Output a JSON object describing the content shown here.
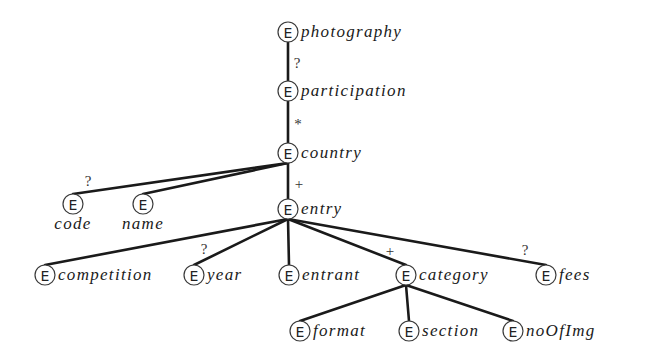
{
  "diagram": {
    "title": "",
    "element_marker": "E",
    "nodes": [
      {
        "id": "photography",
        "label": "photography",
        "x": 288,
        "y": 32,
        "label_pos": "right"
      },
      {
        "id": "participation",
        "label": "participation",
        "x": 288,
        "y": 91,
        "label_pos": "right"
      },
      {
        "id": "country",
        "label": "country",
        "x": 288,
        "y": 153,
        "label_pos": "right"
      },
      {
        "id": "code",
        "label": "code",
        "x": 73,
        "y": 204,
        "label_pos": "below"
      },
      {
        "id": "name",
        "label": "name",
        "x": 143,
        "y": 204,
        "label_pos": "below"
      },
      {
        "id": "entry",
        "label": "entry",
        "x": 288,
        "y": 209,
        "label_pos": "right"
      },
      {
        "id": "competition",
        "label": "competition",
        "x": 45,
        "y": 275,
        "label_pos": "right"
      },
      {
        "id": "year",
        "label": "year",
        "x": 194,
        "y": 275,
        "label_pos": "right"
      },
      {
        "id": "entrant",
        "label": "entrant",
        "x": 289,
        "y": 275,
        "label_pos": "right"
      },
      {
        "id": "category",
        "label": "category",
        "x": 406,
        "y": 275,
        "label_pos": "right"
      },
      {
        "id": "fees",
        "label": "fees",
        "x": 546,
        "y": 275,
        "label_pos": "right"
      },
      {
        "id": "format",
        "label": "format",
        "x": 300,
        "y": 331,
        "label_pos": "right"
      },
      {
        "id": "section",
        "label": "section",
        "x": 409,
        "y": 331,
        "label_pos": "right"
      },
      {
        "id": "noOfImg",
        "label": "noOfImg",
        "x": 513,
        "y": 331,
        "label_pos": "right"
      }
    ],
    "edges": [
      {
        "from": "photography",
        "to": "participation",
        "cardinality": "?",
        "card_x": 297,
        "card_y": 68
      },
      {
        "from": "participation",
        "to": "country",
        "cardinality": "*",
        "card_x": 298,
        "card_y": 129
      },
      {
        "from": "country",
        "to": "code",
        "cardinality": "?",
        "card_x": 88,
        "card_y": 186
      },
      {
        "from": "country",
        "to": "name",
        "cardinality": "",
        "card_x": 0,
        "card_y": 0
      },
      {
        "from": "country",
        "to": "entry",
        "cardinality": "+",
        "card_x": 299,
        "card_y": 189
      },
      {
        "from": "entry",
        "to": "competition",
        "cardinality": "",
        "card_x": 0,
        "card_y": 0
      },
      {
        "from": "entry",
        "to": "year",
        "cardinality": "?",
        "card_x": 204,
        "card_y": 254
      },
      {
        "from": "entry",
        "to": "entrant",
        "cardinality": "",
        "card_x": 0,
        "card_y": 0
      },
      {
        "from": "entry",
        "to": "category",
        "cardinality": "+",
        "card_x": 390,
        "card_y": 256
      },
      {
        "from": "entry",
        "to": "fees",
        "cardinality": "?",
        "card_x": 525,
        "card_y": 255
      },
      {
        "from": "category",
        "to": "format",
        "cardinality": "",
        "card_x": 0,
        "card_y": 0
      },
      {
        "from": "category",
        "to": "section",
        "cardinality": "",
        "card_x": 0,
        "card_y": 0
      },
      {
        "from": "category",
        "to": "noOfImg",
        "cardinality": "",
        "card_x": 0,
        "card_y": 0
      }
    ]
  }
}
